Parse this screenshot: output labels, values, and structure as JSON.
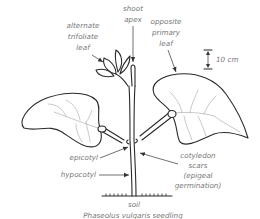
{
  "diagram": {
    "title": "Phaseolus vulgaris seedling",
    "title_italic_part": "Phaseolus vulgaris",
    "title_rest": " seedling",
    "labels": {
      "shoot_apex": [
        "shoot",
        "apex"
      ],
      "alternate_trifoliate_leaf": [
        "alternate",
        "trifoliate",
        "leaf"
      ],
      "opposite_primary_leaf": [
        "opposite",
        "primary",
        "leaf"
      ],
      "scale": "10 cm",
      "epicotyl": "epicotyl",
      "hypocotyl": "hypocotyl",
      "cotyledon_scars": [
        "cotyledon",
        "scars",
        "(epigeal",
        "germination)"
      ],
      "soil": "soil"
    },
    "colors": {
      "ink": "#2a2a2a",
      "label_text": "#777777",
      "vein": "#9a9a9a",
      "background": "#ffffff"
    }
  }
}
